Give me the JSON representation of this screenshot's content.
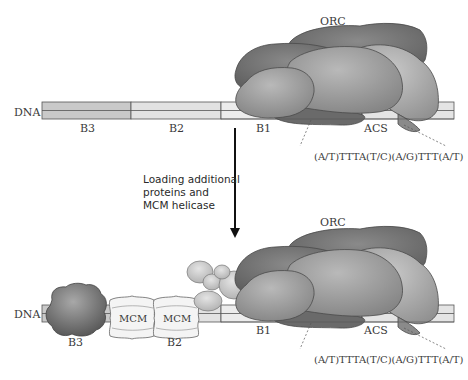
{
  "diagram": {
    "top_panel": {
      "dna_label": "DNA",
      "segments": [
        {
          "label": "B3",
          "color": "#c9c9c9"
        },
        {
          "label": "B2",
          "color": "#e2e2e2"
        },
        {
          "label": "B1",
          "color": "#ececec"
        },
        {
          "label": "ACS",
          "color": "#a9a9a9"
        },
        {
          "label": "",
          "color": "#e4e4e4"
        }
      ],
      "complex_label": "ORC",
      "sequence": "(A/T)TTTA(T/C)(A/G)TTT(A/T)"
    },
    "transition": {
      "caption_lines": [
        "Loading additional",
        "proteins and",
        "MCM helicase"
      ],
      "arrow": "down-arrow"
    },
    "bottom_panel": {
      "dna_label": "DNA",
      "segments": [
        {
          "label": "B3",
          "color": "#c9c9c9"
        },
        {
          "label": "B2",
          "color": "#e2e2e2"
        },
        {
          "label": "B1",
          "color": "#ececec"
        },
        {
          "label": "ACS",
          "color": "#a9a9a9"
        },
        {
          "label": "",
          "color": "#e4e4e4"
        }
      ],
      "complex_label": "ORC",
      "mcm_labels": [
        "MCM",
        "MCM"
      ],
      "sequence": "(A/T)TTTA(T/C)(A/G)TTT(A/T)"
    },
    "colors": {
      "orc_dark": "#6f6f6f",
      "orc_mid": "#8c8c8c",
      "orc_light": "#a6a6a6",
      "outline": "#4a4a4a",
      "mcm_fill": "#f4f4f4",
      "b3_protein": "#7a7a7a",
      "small_protein": "#c8c8c8"
    }
  }
}
